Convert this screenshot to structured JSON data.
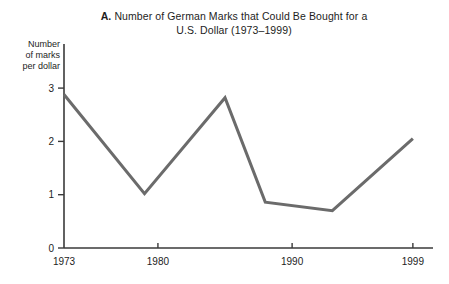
{
  "chart_data": {
    "type": "line",
    "title": "A. Number of German Marks that Could Be Bought for a U.S. Dollar (1973–1999)",
    "title_panel_letter": "A.",
    "title_line1": "Number of German Marks that Could Be Bought for a",
    "title_line2": "U.S. Dollar (1973–1999)",
    "xlabel": "",
    "ylabel": "Number of marks per dollar",
    "ylabel_line1": "Number",
    "ylabel_line2": "of marks",
    "ylabel_line3": "per dollar",
    "xlim": [
      1973,
      2000.5
    ],
    "ylim": [
      0,
      3.25
    ],
    "x_tick_values": [
      1973,
      1980,
      1990,
      1999
    ],
    "x_tick_labels": [
      "1973",
      "1980",
      "1990",
      "1999"
    ],
    "y_tick_values": [
      0,
      1,
      2,
      3
    ],
    "y_tick_labels": [
      "0",
      "1",
      "2",
      "3"
    ],
    "grid": false,
    "legend": false,
    "series": [
      {
        "name": "Marks per dollar",
        "color": "#6b6b6b",
        "line_width": 3,
        "x": [
          1973,
          1979,
          1985,
          1988,
          1993,
          1999
        ],
        "values": [
          2.88,
          1.02,
          2.82,
          0.86,
          0.7,
          2.05
        ]
      }
    ]
  },
  "style": {
    "axis_color": "#3a3a3a",
    "line_color": "#6b6b6b",
    "text_color": "#1d1d1d",
    "background": "#ffffff"
  }
}
